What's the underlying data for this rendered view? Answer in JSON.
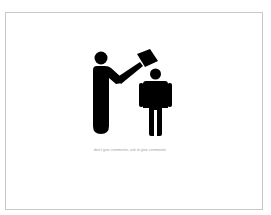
{
  "slide": {
    "caption": "don't give comments, ask to give comments",
    "border_color": "#c8c8c8",
    "background_color": "#ffffff"
  },
  "illustration": {
    "description": "pictogram of a person hitting another person on the head with a hammer",
    "fill_color": "#000000",
    "figures": [
      "person-with-hammer",
      "person-being-hit"
    ]
  }
}
